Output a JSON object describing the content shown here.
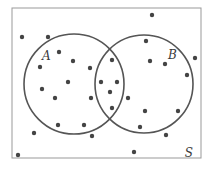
{
  "diagram": {
    "type": "venn",
    "universe_label": "S",
    "sets": [
      {
        "label": "A",
        "cx": 74,
        "cy": 84,
        "r": 50,
        "label_x": 42,
        "label_y": 60
      },
      {
        "label": "B",
        "cx": 144,
        "cy": 84,
        "r": 49,
        "label_x": 168,
        "label_y": 59
      }
    ],
    "frame": {
      "x": 12,
      "y": 8,
      "width": 189,
      "height": 150
    },
    "universe_label_pos": {
      "x": 193,
      "y": 157
    },
    "colors": {
      "stroke": "#555555",
      "dot": "#444444",
      "frame": "#999999"
    },
    "points": [
      [
        152,
        15
      ],
      [
        22,
        37
      ],
      [
        48,
        37
      ],
      [
        146,
        41
      ],
      [
        59,
        52
      ],
      [
        195,
        58
      ],
      [
        40,
        67
      ],
      [
        73,
        61
      ],
      [
        150,
        61
      ],
      [
        165,
        64
      ],
      [
        90,
        68
      ],
      [
        112,
        60
      ],
      [
        68,
        82
      ],
      [
        101,
        82
      ],
      [
        117,
        82
      ],
      [
        187,
        75
      ],
      [
        42,
        89
      ],
      [
        110,
        92
      ],
      [
        55,
        98
      ],
      [
        91,
        98
      ],
      [
        128,
        98
      ],
      [
        112,
        108
      ],
      [
        145,
        111
      ],
      [
        178,
        111
      ],
      [
        58,
        125
      ],
      [
        84,
        125
      ],
      [
        140,
        127
      ],
      [
        34,
        133
      ],
      [
        92,
        136
      ],
      [
        166,
        135
      ],
      [
        18,
        155
      ],
      [
        134,
        152
      ]
    ]
  }
}
